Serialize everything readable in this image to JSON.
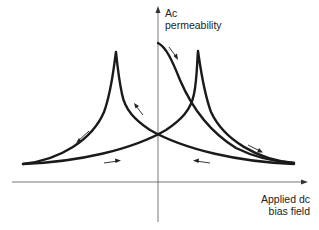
{
  "diagram": {
    "type": "hysteresis-butterfly-curve",
    "y_axis_label_line1": "Ac",
    "y_axis_label_line2": "permeability",
    "x_axis_label_line1": "Applied dc",
    "x_axis_label_line2": "bias field",
    "curves": [
      {
        "name": "increasing-field-branch",
        "peak_side": "right",
        "direction": "left-to-right"
      },
      {
        "name": "decreasing-field-branch",
        "peak_side": "left",
        "direction": "right-to-left"
      },
      {
        "name": "initial-branch",
        "start": "top-of-y-axis",
        "direction": "down-right"
      }
    ],
    "arrow_count": 7,
    "stroke_color": "#1a1a1a",
    "background": "#ffffff"
  }
}
